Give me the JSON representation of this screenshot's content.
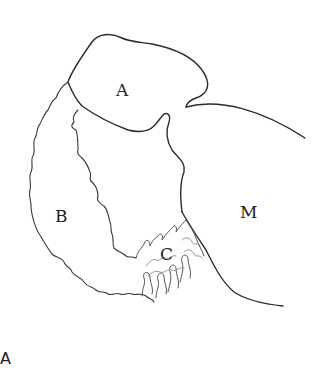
{
  "figure": {
    "type": "anatomical line drawing",
    "panel_label": "A",
    "region_labels": {
      "a": "A",
      "b": "B",
      "c": "C",
      "m": "M"
    },
    "colors": {
      "background": "#ffffff",
      "line": "#2b2b2b",
      "label": "#222222"
    }
  }
}
